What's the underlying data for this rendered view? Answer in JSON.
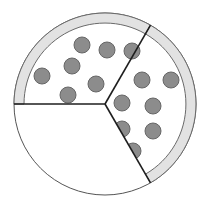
{
  "diagram": {
    "title": "",
    "sectors_total": 3,
    "sectors": [
      {
        "name": "upper-left",
        "has_crust": true,
        "topping_count": 7
      },
      {
        "name": "right",
        "has_crust": true,
        "topping_count": 7
      },
      {
        "name": "lower-left",
        "has_crust": false,
        "topping_count": 0
      }
    ],
    "filled_fraction": "2/3",
    "colors": {
      "background": "#ffffff",
      "crust_fill": "#e2e2e2",
      "crust_stroke": "#6a6a6a",
      "outline": "#555555",
      "divider": "#1e1e1e",
      "topping_fill": "#8c8c8c",
      "topping_stroke": "#666666"
    }
  }
}
